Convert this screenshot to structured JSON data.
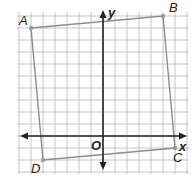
{
  "diagram": {
    "type": "coordinate-plane-quadrilateral",
    "axes": {
      "x_label": "x",
      "y_label": "y",
      "origin_label": "O"
    },
    "grid": {
      "unit_px": 12,
      "x_min": -7,
      "x_max": 7,
      "y_min": -3,
      "y_max": 10
    },
    "vertices": [
      {
        "label": "A",
        "x": -6,
        "y": 9
      },
      {
        "label": "B",
        "x": 5,
        "y": 10
      },
      {
        "label": "C",
        "x": 6,
        "y": -1
      },
      {
        "label": "D",
        "x": -5,
        "y": -2
      }
    ],
    "colors": {
      "grid": "#b8b8b8",
      "axis": "#222222",
      "shape": "#8c8c8c",
      "point": "#9a9a9a"
    }
  }
}
